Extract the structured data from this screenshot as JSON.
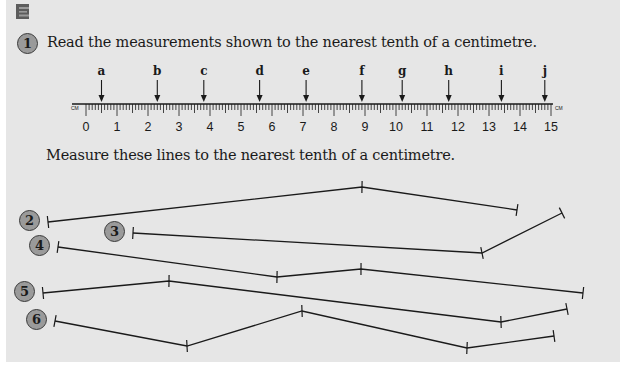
{
  "section": {
    "letter": "E",
    "color": "#5a5a5a"
  },
  "question1": {
    "number": "1",
    "instruction": "Read the measurements shown to the nearest tenth of a centimetre.",
    "ruler": {
      "unit_label_left": "CM",
      "unit_label_right": "CM",
      "min": 0,
      "max": 15,
      "tick_labels": [
        "0",
        "1",
        "2",
        "3",
        "4",
        "5",
        "6",
        "7",
        "8",
        "9",
        "10",
        "11",
        "12",
        "13",
        "14",
        "15"
      ],
      "arrows": [
        {
          "label": "a",
          "value": 0.5
        },
        {
          "label": "b",
          "value": 2.3
        },
        {
          "label": "c",
          "value": 3.8
        },
        {
          "label": "d",
          "value": 5.6
        },
        {
          "label": "e",
          "value": 7.1
        },
        {
          "label": "f",
          "value": 8.9
        },
        {
          "label": "g",
          "value": 10.2
        },
        {
          "label": "h",
          "value": 11.7
        },
        {
          "label": "i",
          "value": 13.4
        },
        {
          "label": "j",
          "value": 14.8
        }
      ]
    }
  },
  "lines_instruction": "Measure these lines to the nearest tenth of a centimetre.",
  "lines": [
    {
      "number": "2",
      "points": [
        [
          48,
          222
        ],
        [
          362,
          187
        ],
        [
          517,
          210
        ]
      ]
    },
    {
      "number": "3",
      "points": [
        [
          133,
          233
        ],
        [
          482,
          253
        ],
        [
          562,
          213
        ]
      ]
    },
    {
      "number": "4",
      "points": [
        [
          58,
          247
        ],
        [
          277,
          277
        ],
        [
          361,
          269
        ],
        [
          583,
          293
        ]
      ]
    },
    {
      "number": "5",
      "points": [
        [
          43,
          293
        ],
        [
          169,
          281
        ],
        [
          501,
          322
        ],
        [
          567,
          309
        ]
      ]
    },
    {
      "number": "6",
      "points": [
        [
          55,
          321
        ],
        [
          187,
          346
        ],
        [
          302,
          311
        ],
        [
          467,
          348
        ],
        [
          554,
          336
        ]
      ]
    }
  ],
  "colors": {
    "panel": "#e6e6e6",
    "badge": "#9a9a9a",
    "ink": "#1a1a1a"
  }
}
